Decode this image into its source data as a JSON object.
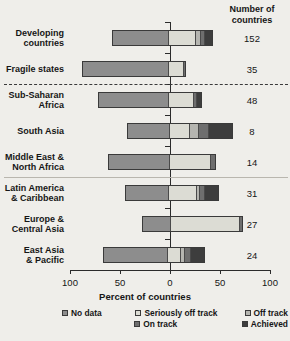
{
  "header": {
    "count_title_line1": "Number of",
    "count_title_line2": "countries"
  },
  "axis": {
    "title": "Percent of countries",
    "tick_labels": [
      "100",
      "50",
      "0",
      "50",
      "100"
    ],
    "tick_values": [
      -100,
      -50,
      0,
      50,
      100
    ],
    "min": -100,
    "max": 100
  },
  "legend": {
    "items": [
      {
        "label": "No data",
        "color": "#8d8d8d"
      },
      {
        "label": "Seriously off track",
        "color": "#dcdcd4"
      },
      {
        "label": "Off track",
        "color": "#b5b5b0"
      },
      {
        "label": "On track",
        "color": "#6e6e6e"
      },
      {
        "label": "Achieved",
        "color": "#3d3d3d"
      }
    ],
    "row1": [
      "No data",
      "Seriously off track",
      "Off track"
    ],
    "row2": [
      "On track",
      "Achieved"
    ]
  },
  "chart_data": {
    "type": "bar",
    "title": "",
    "subtitle": "",
    "xlabel": "Percent of countries",
    "ylabel": "",
    "xlim": [
      -100,
      100
    ],
    "grid": false,
    "legend_position": "bottom",
    "orientation": "horizontal-diverging-stacked",
    "note": "Bars diverge from 0: 'No data' extends left (negative); remaining categories stack to the right.",
    "categories": [
      "Developing countries",
      "Fragile states",
      "Sub-Saharan Africa",
      "South Asia",
      "Middle East & North Africa",
      "Latin America & Caribbean",
      "Europe & Central Asia",
      "East Asia & Pacific"
    ],
    "series": [
      {
        "name": "No data",
        "values": [
          -58,
          -88,
          -72,
          -43,
          -62,
          -45,
          -28,
          -67
        ]
      },
      {
        "name": "Seriously off track",
        "values": [
          28,
          15,
          26,
          21,
          42,
          29,
          71,
          13
        ]
      },
      {
        "name": "Off track",
        "values": [
          4,
          0,
          0,
          8,
          0,
          2,
          0,
          3
        ]
      },
      {
        "name": "On track",
        "values": [
          4,
          1,
          2,
          10,
          4,
          4,
          2,
          5
        ]
      },
      {
        "name": "Achieved",
        "values": [
          7,
          0,
          4,
          24,
          0,
          14,
          0,
          14
        ]
      }
    ],
    "counts": [
      152,
      35,
      48,
      8,
      14,
      31,
      27,
      24
    ]
  },
  "rows": [
    {
      "label": "Developing\ncountries",
      "count": "152",
      "left": 58,
      "right": [
        28,
        4,
        4,
        7
      ]
    },
    {
      "label": "Fragile states",
      "count": "35",
      "left": 88,
      "right": [
        15,
        0,
        1,
        0
      ]
    },
    {
      "label": "Sub-Saharan\nAfrica",
      "count": "48",
      "left": 72,
      "right": [
        26,
        0,
        2,
        4
      ]
    },
    {
      "label": "South Asia",
      "count": "8",
      "left": 43,
      "right": [
        21,
        8,
        10,
        24
      ]
    },
    {
      "label": "Middle East &\nNorth Africa",
      "count": "14",
      "left": 62,
      "right": [
        42,
        0,
        4,
        0
      ]
    },
    {
      "label": "Latin America\n& Caribbean",
      "count": "31",
      "left": 45,
      "right": [
        29,
        2,
        4,
        14
      ]
    },
    {
      "label": "Europe &\nCentral Asia",
      "count": "27",
      "left": 28,
      "right": [
        71,
        0,
        2,
        0
      ]
    },
    {
      "label": "East Asia\n& Pacific",
      "count": "24",
      "left": 67,
      "right": [
        13,
        3,
        5,
        14
      ]
    }
  ]
}
